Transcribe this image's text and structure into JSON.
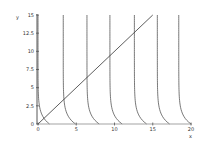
{
  "chart_data": {
    "type": "line",
    "title": "",
    "xlabel": "x",
    "ylabel": "y",
    "xlim": [
      0,
      20
    ],
    "ylim": [
      0,
      15
    ],
    "grid": false,
    "legend": null,
    "x_ticks": [
      "0",
      "5",
      "10",
      "15",
      "20"
    ],
    "y_ticks": [
      "0",
      "2.5",
      "5",
      "7.5",
      "10",
      "12.5",
      "15"
    ],
    "series": [
      {
        "name": "y = x",
        "kind": "line",
        "x": [
          0,
          15
        ],
        "y": [
          0,
          15
        ]
      },
      {
        "name": "curve-1",
        "kind": "decay",
        "x0": 0.0,
        "x_end": 1.5
      },
      {
        "name": "curve-2",
        "kind": "decay",
        "x0": 3.3,
        "x_end": 4.9
      },
      {
        "name": "curve-3",
        "kind": "decay",
        "x0": 6.4,
        "x_end": 8.0
      },
      {
        "name": "curve-4",
        "kind": "decay",
        "x0": 9.4,
        "x_end": 11.0
      },
      {
        "name": "curve-5",
        "kind": "decay",
        "x0": 12.6,
        "x_end": 14.2
      },
      {
        "name": "curve-6",
        "kind": "decay",
        "x0": 15.6,
        "x_end": 17.2
      },
      {
        "name": "curve-7",
        "kind": "decay",
        "x0": 18.4,
        "x_end": 20.0
      }
    ]
  },
  "colors": {
    "line": "#333333",
    "axis": "#555555",
    "curve": "#555555"
  }
}
